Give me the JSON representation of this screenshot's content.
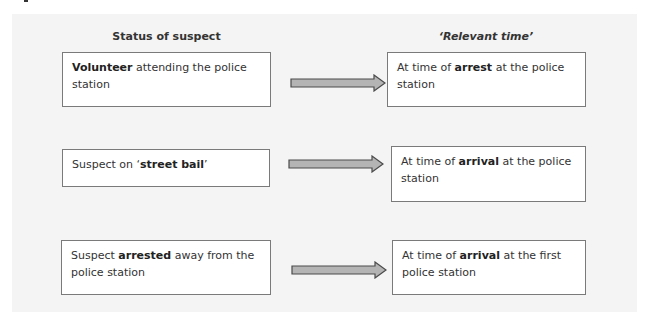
{
  "headers": {
    "status_of_suspect": "Status of suspect",
    "relevant_time": "‘Relevant time’"
  },
  "rows": [
    {
      "status": {
        "before": "",
        "bold": "Volunteer",
        "after": " attending the police station"
      },
      "relevant_time": {
        "before": "At time of ",
        "bold": "arrest",
        "after": " at the police station"
      }
    },
    {
      "status": {
        "before": "Suspect on ‘",
        "bold": "street bail",
        "after": "’"
      },
      "relevant_time": {
        "before": "At time of ",
        "bold": "arrival",
        "after": " at the police station"
      }
    },
    {
      "status": {
        "before": "Suspect ",
        "bold": "arrested",
        "after": " away from the police station"
      },
      "relevant_time": {
        "before": "At time of ",
        "bold": "arrival",
        "after": " at the first police station"
      }
    }
  ],
  "arrow_icon": "right-arrow-icon",
  "colors": {
    "panel_background": "#f4f4f4",
    "box_border": "#7a7a7a",
    "arrow_fill": "#b4b4b4",
    "arrow_stroke": "#4a4a4a"
  }
}
